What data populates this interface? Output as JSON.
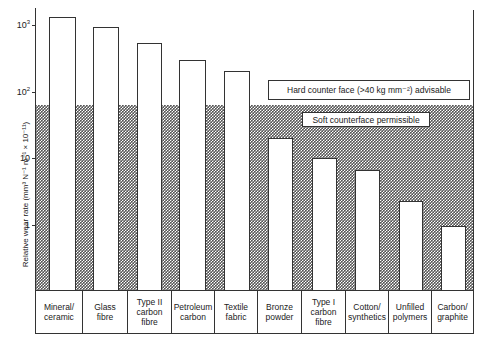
{
  "chart_data": {
    "type": "bar",
    "title": "",
    "xlabel": "",
    "ylabel": "Relative wear rate (mm³ N⁻¹ m⁻¹ × 10⁻¹¹)",
    "yscale": "log",
    "ylim": [
      0.1,
      2000
    ],
    "yticks": [
      "1",
      "10",
      "10²",
      "10³"
    ],
    "grid": false,
    "categories": [
      "Mineral/ ceramic",
      "Glass fibre",
      "Type II carbon fibre",
      "Petroleum carbon",
      "Textile fabric",
      "Bronze powder",
      "Type I carbon fibre",
      "Cotton/ synthetics",
      "Unfilled polymers",
      "Carbon/ graphite"
    ],
    "values": [
      1300,
      930,
      540,
      300,
      205,
      20,
      10,
      6.7,
      2.3,
      0.95
    ],
    "regions": [
      {
        "label": "Hard counter face (>40 kg mm⁻²) advisable",
        "range": [
          63,
          2000
        ]
      },
      {
        "label": "Soft counterface permissible",
        "range": [
          0.1,
          63
        ],
        "style": "cross-hatched"
      }
    ]
  },
  "axis": {
    "ylabel": "Relative wear rate (mm³ N⁻¹ m⁻¹ × 10⁻¹¹)",
    "ticks": [
      {
        "base": "10",
        "exp": "3",
        "y": 25
      },
      {
        "base": "10",
        "exp": "2",
        "y": 92
      },
      {
        "base": "10",
        "exp": "",
        "y": 158
      },
      {
        "base": "1",
        "exp": "",
        "y": 225
      }
    ]
  },
  "annotations": {
    "hard": "Hard counter face (>40 kg mm⁻²) advisable",
    "soft": "Soft counterface permissible"
  },
  "bars": [
    {
      "label": "Mineral/\nceramic",
      "x": 49,
      "w": 27,
      "top": 17
    },
    {
      "label": "Glass\nfibre",
      "x": 93,
      "w": 26,
      "top": 27
    },
    {
      "label": "Type II\ncarbon\nfibre",
      "x": 137,
      "w": 25,
      "top": 43
    },
    {
      "label": "Petroleum\ncarbon",
      "x": 179,
      "w": 27,
      "top": 60
    },
    {
      "label": "Textile\nfabric",
      "x": 224,
      "w": 26,
      "top": 71
    },
    {
      "label": "Bronze\npowder",
      "x": 268,
      "w": 25,
      "top": 138
    },
    {
      "label": "Type I\ncarbon\nfibre",
      "x": 312,
      "w": 25,
      "top": 158
    },
    {
      "label": "Cotton/\nsynthetics",
      "x": 355,
      "w": 25,
      "top": 170
    },
    {
      "label": "Unfilled\npolymers",
      "x": 399,
      "w": 24,
      "top": 201
    },
    {
      "label": "Carbon/\ngraphite",
      "x": 441,
      "w": 25,
      "top": 226
    }
  ],
  "cells": [
    {
      "x": 35,
      "w": 48
    },
    {
      "x": 83,
      "w": 45
    },
    {
      "x": 128,
      "w": 44
    },
    {
      "x": 172,
      "w": 43
    },
    {
      "x": 215,
      "w": 43
    },
    {
      "x": 258,
      "w": 44
    },
    {
      "x": 302,
      "w": 44
    },
    {
      "x": 346,
      "w": 43
    },
    {
      "x": 389,
      "w": 43
    },
    {
      "x": 432,
      "w": 42
    }
  ]
}
